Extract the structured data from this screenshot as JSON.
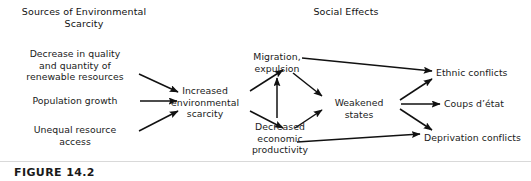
{
  "figure": {
    "caption": "FIGURE 14.2",
    "headings": {
      "left": "Sources of Environmental\nScarcity",
      "right": "Social Effects"
    },
    "nodes": {
      "decrease_quality": "Decrease in quality\nand quantity of\nrenewable resources",
      "population_growth": "Population growth",
      "unequal_access": "Unequal resource\naccess",
      "increased_scarcity": "Increased\nenvironmental\nscarcity",
      "migration": "Migration,\nexpulsion",
      "decreased_productivity": "Decreased\neconomic\nproductivity",
      "weakened_states": "Weakened states",
      "ethnic_conflicts": "Ethnic conflicts",
      "coups": "Coups d’état",
      "deprivation_conflicts": "Deprivation conflicts"
    },
    "edges": [
      {
        "from": "decrease_quality",
        "to": "increased_scarcity"
      },
      {
        "from": "population_growth",
        "to": "increased_scarcity"
      },
      {
        "from": "unequal_access",
        "to": "increased_scarcity"
      },
      {
        "from": "increased_scarcity",
        "to": "migration"
      },
      {
        "from": "increased_scarcity",
        "to": "decreased_productivity"
      },
      {
        "from": "decreased_productivity",
        "to": "migration"
      },
      {
        "from": "migration",
        "to": "weakened_states"
      },
      {
        "from": "decreased_productivity",
        "to": "weakened_states"
      },
      {
        "from": "migration",
        "to": "ethnic_conflicts"
      },
      {
        "from": "weakened_states",
        "to": "ethnic_conflicts"
      },
      {
        "from": "weakened_states",
        "to": "coups"
      },
      {
        "from": "weakened_states",
        "to": "deprivation_conflicts"
      },
      {
        "from": "decreased_productivity",
        "to": "deprivation_conflicts"
      }
    ],
    "colors": {
      "background": "#ffffff",
      "text": "#1a1a1a",
      "arrow": "#111111",
      "rule": "#d9d9d9"
    }
  }
}
